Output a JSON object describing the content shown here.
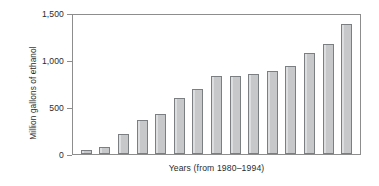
{
  "chart_data": {
    "type": "bar",
    "title": "",
    "xlabel": "Years (from 1980–1994)",
    "ylabel": "Million gallons of ethanol",
    "ylim": [
      0,
      1500
    ],
    "yticks": [
      0,
      500,
      1000,
      1500
    ],
    "ytick_labels": [
      "0",
      "500",
      "1,000",
      "1,500"
    ],
    "grid": false,
    "legend": null,
    "categories": [
      "1980",
      "1981",
      "1982",
      "1983",
      "1984",
      "1985",
      "1986",
      "1987",
      "1988",
      "1989",
      "1990",
      "1991",
      "1992",
      "1993",
      "1994"
    ],
    "values": [
      40,
      75,
      210,
      365,
      425,
      595,
      690,
      825,
      835,
      855,
      880,
      935,
      1075,
      1175,
      1380
    ],
    "bar_fill_color": "#c6c8c9",
    "bar_edge_color": "#7c7f81",
    "axis_color": "#8d8d8d",
    "text_color": "#2b2b2b",
    "background_color": "#ffffff"
  }
}
